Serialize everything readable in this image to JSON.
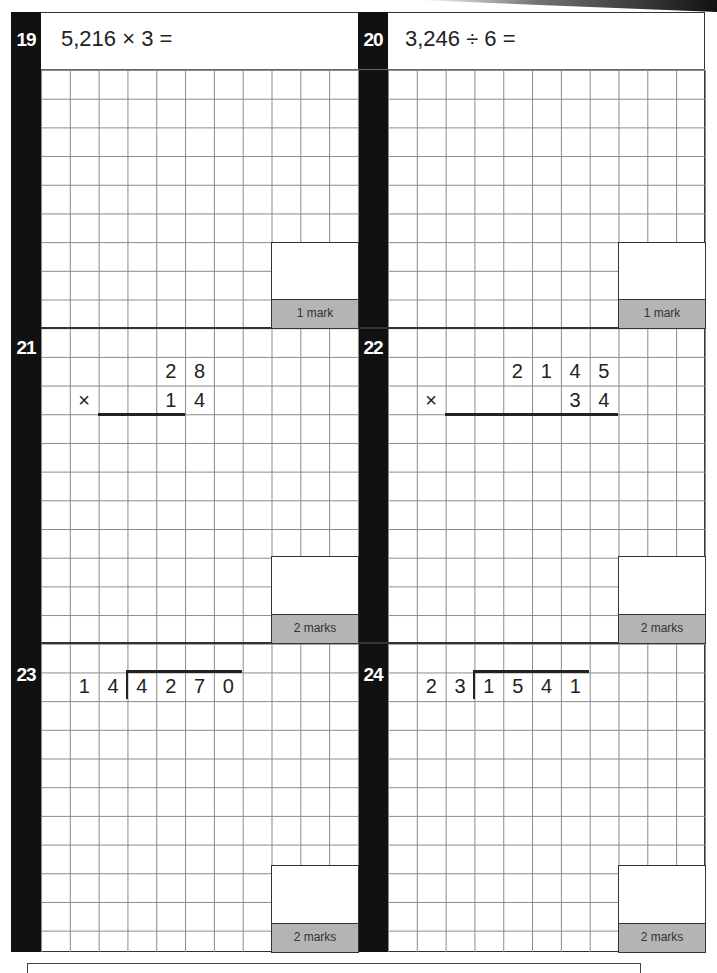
{
  "questions": [
    {
      "number": "19",
      "prompt": "5,216 × 3 =",
      "marks": "1 mark"
    },
    {
      "number": "20",
      "prompt": "3,246 ÷ 6 =",
      "marks": "1 mark"
    },
    {
      "number": "21",
      "marks": "2 marks",
      "layout": {
        "type": "long-multiplication",
        "top": [
          "2",
          "8"
        ],
        "operator": "×",
        "bottom": [
          "1",
          "4"
        ]
      }
    },
    {
      "number": "22",
      "marks": "2 marks",
      "layout": {
        "type": "long-multiplication",
        "top": [
          "2",
          "1",
          "4",
          "5"
        ],
        "operator": "×",
        "bottom": [
          "3",
          "4"
        ]
      }
    },
    {
      "number": "23",
      "marks": "2 marks",
      "layout": {
        "type": "long-division",
        "divisor": [
          "1",
          "4"
        ],
        "dividend": [
          "4",
          "2",
          "7",
          "0"
        ]
      }
    },
    {
      "number": "24",
      "marks": "2 marks",
      "layout": {
        "type": "long-division",
        "divisor": [
          "2",
          "3"
        ],
        "dividend": [
          "1",
          "5",
          "4",
          "1"
        ]
      }
    }
  ],
  "colors": {
    "bar": "#111111",
    "marks_fill": "#b4b4b4",
    "grid_line": "#8a8a8a"
  }
}
